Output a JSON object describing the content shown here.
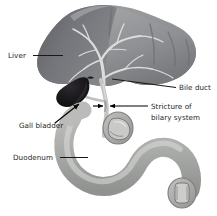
{
  "figure": {
    "background_color": "#ffffff",
    "label_color": "#231f1d"
  },
  "labels": [
    {
      "id": "liver",
      "text": "Liver",
      "icon": "text-label",
      "x": 8,
      "y": 58,
      "leader": {
        "x1": 33,
        "y1": 55.5,
        "x2": 63,
        "y2": 55.5
      }
    },
    {
      "id": "bile-duct",
      "text": "Bile duct",
      "icon": "text-label",
      "x": 178,
      "y": 90,
      "leader": {
        "x1": 176,
        "y1": 87.5,
        "x2": 112,
        "y2": 80
      }
    },
    {
      "id": "stricture-line-1",
      "text": "Stricture of",
      "icon": "text-label",
      "x": 151,
      "y": 109
    },
    {
      "id": "stricture-line-2",
      "text": "bilary system",
      "icon": "text-label",
      "x": 151,
      "y": 121
    },
    {
      "id": "gall-bladder",
      "text": "Gall bladder",
      "icon": "text-label",
      "x": 19,
      "y": 128
    },
    {
      "id": "duodenum",
      "text": "Duodenum",
      "icon": "text-label",
      "x": 13,
      "y": 160,
      "leader": {
        "x1": 60,
        "y1": 157.5,
        "x2": 88,
        "y2": 157.5
      }
    }
  ],
  "anatomy": {
    "liver": {
      "name": "liver",
      "left_lobe_color": "#6f7073",
      "right_lobe_color": "#8e9093",
      "vessel_color": "#d7d8d6"
    },
    "gall_bladder": {
      "name": "gall-bladder",
      "color": "#17161a"
    },
    "bile_duct": {
      "name": "bile-duct",
      "color": "#b9babb"
    },
    "duodenum": {
      "name": "duodenum",
      "fill_color": "#b5b6b4",
      "shadow_color": "#8a8c8a",
      "highlight_color": "#d9dad7"
    },
    "cutaway_upper": {
      "name": "duct-cross-section",
      "color": "#a9aaa8"
    },
    "cutaway_lower": {
      "name": "duodenum-cross-section",
      "color": "#a3a4a2"
    }
  },
  "annotations": {
    "stricture_arrows": {
      "name": "stricture-arrows",
      "description": "Two opposing arrows converging on the narrowed bile duct",
      "left_arrow": {
        "x1": 93,
        "y1": 106,
        "x2": 104,
        "y2": 106
      },
      "right_arrow": {
        "x1": 148,
        "y1": 106,
        "x2": 110,
        "y2": 106
      }
    },
    "gall_bladder_arrow": {
      "name": "gall-bladder-arrow",
      "x1": 56,
      "y1": 122,
      "x2": 79,
      "y2": 104
    }
  }
}
